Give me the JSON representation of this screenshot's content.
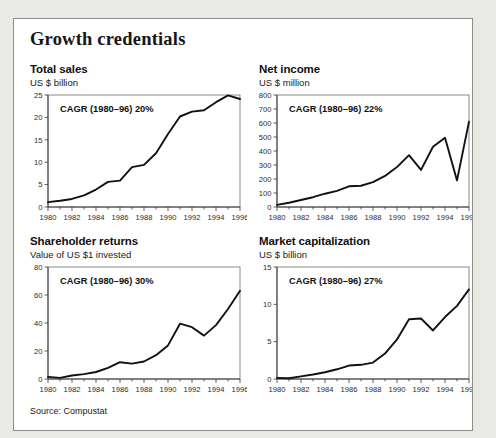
{
  "exhibit": {
    "title": "Growth credentials",
    "source": "Source: Compustat"
  },
  "chart_data": [
    {
      "id": "total-sales",
      "type": "line",
      "title": "Total sales",
      "subtitle": "US $ billion",
      "annotation": "CAGR (1980–96) 20%",
      "xlabel": "",
      "ylabel": "US $ billion",
      "x": [
        1980,
        1981,
        1982,
        1983,
        1984,
        1985,
        1986,
        1987,
        1988,
        1989,
        1990,
        1991,
        1992,
        1993,
        1994,
        1995,
        1996
      ],
      "values": [
        1.1,
        1.4,
        1.8,
        2.6,
        3.9,
        5.6,
        5.9,
        8.9,
        9.4,
        12.0,
        16.3,
        20.2,
        21.3,
        21.6,
        23.4,
        24.9,
        24.1
      ],
      "xticks": [
        1980,
        1982,
        1984,
        1986,
        1988,
        1990,
        1992,
        1994,
        1996
      ],
      "yticks": [
        0,
        5,
        10,
        15,
        20,
        25
      ],
      "ylim": [
        0,
        25
      ],
      "xlim": [
        1980,
        1996
      ],
      "grid": false,
      "legend": "none"
    },
    {
      "id": "net-income",
      "type": "line",
      "title": "Net income",
      "subtitle": "US $ million",
      "annotation": "CAGR (1980–96) 22%",
      "xlabel": "",
      "ylabel": "US $ million",
      "x": [
        1980,
        1981,
        1982,
        1983,
        1984,
        1985,
        1986,
        1987,
        1988,
        1989,
        1990,
        1991,
        1992,
        1993,
        1994,
        1995,
        1996
      ],
      "values": [
        15,
        30,
        50,
        70,
        95,
        115,
        148,
        152,
        178,
        222,
        285,
        370,
        265,
        430,
        495,
        190,
        610
      ],
      "xticks": [
        1980,
        1982,
        1984,
        1986,
        1988,
        1990,
        1992,
        1994,
        1996
      ],
      "yticks": [
        0,
        100,
        200,
        300,
        400,
        500,
        600,
        700,
        800
      ],
      "ylim": [
        0,
        800
      ],
      "xlim": [
        1980,
        1996
      ],
      "grid": false,
      "legend": "none"
    },
    {
      "id": "shareholder-returns",
      "type": "line",
      "title": "Shareholder returns",
      "subtitle": "Value of US $1 invested",
      "annotation": "CAGR (1980–96) 30%",
      "xlabel": "",
      "ylabel": "Value of US $1 invested",
      "x": [
        1980,
        1981,
        1982,
        1983,
        1984,
        1985,
        1986,
        1987,
        1988,
        1989,
        1990,
        1991,
        1992,
        1993,
        1994,
        1995,
        1996
      ],
      "values": [
        1.5,
        0.8,
        2.5,
        3.5,
        5.0,
        8.0,
        12.0,
        11.0,
        12.5,
        17.0,
        24.0,
        39.5,
        37.0,
        31.0,
        38.5,
        50.0,
        63.0
      ],
      "xticks": [
        1980,
        1982,
        1984,
        1986,
        1988,
        1990,
        1992,
        1994,
        1996
      ],
      "yticks": [
        0,
        20,
        40,
        60,
        80
      ],
      "ylim": [
        0,
        80
      ],
      "xlim": [
        1980,
        1996
      ],
      "grid": false,
      "legend": "none"
    },
    {
      "id": "market-capitalization",
      "type": "line",
      "title": "Market capitalization",
      "subtitle": "US $ billion",
      "annotation": "CAGR (1980–96) 27%",
      "xlabel": "",
      "ylabel": "US $ billion",
      "x": [
        1980,
        1981,
        1982,
        1983,
        1984,
        1985,
        1986,
        1987,
        1988,
        1989,
        1990,
        1991,
        1992,
        1993,
        1994,
        1995,
        1996
      ],
      "values": [
        0.15,
        0.1,
        0.35,
        0.6,
        0.9,
        1.3,
        1.8,
        1.9,
        2.2,
        3.4,
        5.3,
        8.0,
        8.1,
        6.5,
        8.3,
        9.8,
        12.0
      ],
      "xticks": [
        1980,
        1982,
        1984,
        1986,
        1988,
        1990,
        1992,
        1994,
        1996
      ],
      "yticks": [
        0,
        5,
        10,
        15
      ],
      "ylim": [
        0,
        15
      ],
      "xlim": [
        1980,
        1996
      ],
      "grid": false,
      "legend": "none"
    }
  ]
}
